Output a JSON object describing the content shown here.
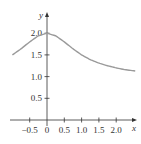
{
  "chart_data": {
    "type": "line",
    "title": "",
    "xlabel": "x",
    "ylabel": "y",
    "xlim": [
      -1.0,
      2.55
    ],
    "ylim": [
      0,
      2.2
    ],
    "x_ticks": [
      "-0.5",
      "0",
      "0.5",
      "1.0",
      "1.5",
      "2.0"
    ],
    "x_tick_values": [
      -0.5,
      0,
      0.5,
      1.0,
      1.5,
      2.0
    ],
    "y_ticks": [
      "0.5",
      "1.0",
      "1.5",
      "2.0"
    ],
    "y_tick_values": [
      0.5,
      1.0,
      1.5,
      2.0
    ],
    "grid": false,
    "legend": null,
    "series": [
      {
        "name": "curve",
        "color": "#9a9a9a",
        "x": [
          -1.0,
          -0.75,
          -0.5,
          -0.25,
          0,
          0.25,
          0.5,
          0.75,
          1.0,
          1.25,
          1.5,
          1.75,
          2.0,
          2.25,
          2.55
        ],
        "y": [
          1.5,
          1.64,
          1.8,
          1.94,
          2.0,
          1.94,
          1.8,
          1.64,
          1.5,
          1.39,
          1.31,
          1.25,
          1.2,
          1.16,
          1.13
        ]
      }
    ]
  }
}
